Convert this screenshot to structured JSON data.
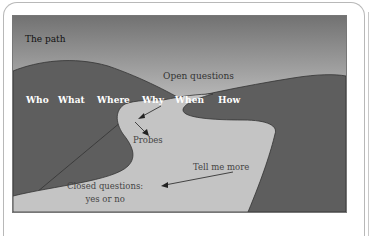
{
  "diagram": {
    "title": "The path",
    "top_label": "Open questions",
    "question_words": [
      "Who",
      "What",
      "Where",
      "Why",
      "When",
      "How"
    ],
    "probes_label": "Probes",
    "tell_label": "Tell me more",
    "closed_label_line1": "Closed questions:",
    "closed_label_line2": "yes or no",
    "colors": {
      "sky_top": "#6e6e6e",
      "sky_bottom": "#f2f2f2",
      "hills": "#5e5e5e",
      "path": "#c4c4c4",
      "question_text": "#ffffff"
    }
  }
}
